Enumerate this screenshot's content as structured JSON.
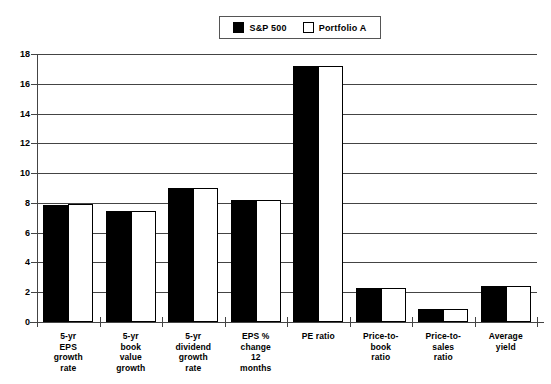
{
  "legend": {
    "entries": [
      {
        "label": "S&P 500",
        "swatch": "filled-square-icon",
        "color": "#000000"
      },
      {
        "label": "Portfolio A",
        "swatch": "hollow-square-icon",
        "color": "#ffffff"
      }
    ]
  },
  "axes": {
    "y_ticks": [
      "0",
      "2",
      "4",
      "6",
      "8",
      "10",
      "12",
      "14",
      "16",
      "18"
    ],
    "y_min": 0,
    "y_max": 18,
    "y_step": 2
  },
  "chart_data": {
    "type": "bar",
    "title": "",
    "subtitle": "",
    "xlabel": "",
    "ylabel": "",
    "ylim": [
      0,
      18
    ],
    "ytick_step": 2,
    "grid": true,
    "legend_position": "top-center",
    "categories": [
      "5-yr\nEPS\ngrowth\nrate",
      "5-yr\nbook\nvalue\ngrowth",
      "5-yr\ndividend\ngrowth\nrate",
      "EPS %\nchange\n12\nmonths",
      "PE  ratio",
      "Price-to-\nbook\nratio",
      "Price-to-\nsales\nratio",
      "Average\nyield"
    ],
    "series": [
      {
        "name": "S&P 500",
        "values": [
          7.85,
          7.45,
          9.0,
          8.2,
          17.2,
          2.3,
          0.85,
          2.4
        ]
      },
      {
        "name": "Portfolio A",
        "values": [
          7.95,
          7.45,
          9.0,
          8.2,
          17.2,
          2.3,
          0.85,
          2.4
        ]
      }
    ]
  }
}
